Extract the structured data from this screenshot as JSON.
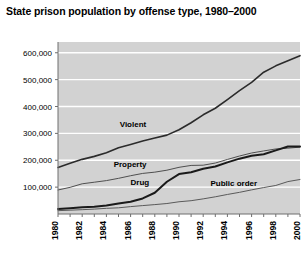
{
  "chart_data": {
    "type": "line",
    "title": "State prison population by offense type, 1980–2000",
    "xlabel": "",
    "ylabel": "",
    "xlim": [
      1980,
      2000
    ],
    "ylim": [
      0,
      640000
    ],
    "grid": true,
    "grid_axis": "y",
    "legend_position": "inline-annotations",
    "plot_background": "#d2d2d2",
    "grid_color": "#ffffff",
    "axis_color": "#6e6e6e",
    "x": [
      1980,
      1981,
      1982,
      1983,
      1984,
      1985,
      1986,
      1987,
      1988,
      1989,
      1990,
      1991,
      1992,
      1993,
      1994,
      1995,
      1996,
      1997,
      1998,
      1999,
      2000
    ],
    "y_ticks": [
      100000,
      200000,
      300000,
      400000,
      500000,
      600000
    ],
    "y_tick_labels": [
      "100,000",
      "200,000",
      "300,000",
      "400,000",
      "500,000",
      "600,000"
    ],
    "x_ticks": [
      1980,
      1982,
      1984,
      1986,
      1988,
      1990,
      1992,
      1994,
      1996,
      1998,
      2000
    ],
    "x_tick_labels": [
      "1980",
      "1982",
      "1984",
      "1986",
      "1988",
      "1990",
      "1992",
      "1994",
      "1996",
      "1998",
      "2000"
    ],
    "series": [
      {
        "name": "Violent",
        "color": "#2b2b2b",
        "width": 1.6,
        "label_x": 1985.1,
        "label_y": 322000,
        "values": [
          173300,
          188800,
          203300,
          214400,
          227700,
          246200,
          258600,
          271300,
          282700,
          293500,
          313600,
          339700,
          369100,
          393500,
          425700,
          459000,
          490000,
          527600,
          551300,
          570000,
          589100
        ]
      },
      {
        "name": "Property",
        "color": "#4f4f4f",
        "width": 1.0,
        "label_x": 1984.6,
        "label_y": 175000,
        "values": [
          89300,
          99200,
          112400,
          118300,
          124300,
          132700,
          142400,
          151000,
          155700,
          163000,
          173700,
          180700,
          181600,
          189600,
          203000,
          215800,
          227000,
          234600,
          242000,
          245000,
          248800
        ]
      },
      {
        "name": "Drug",
        "color": "#1a1a1a",
        "width": 2.0,
        "label_x": 1986.0,
        "label_y": 108000,
        "values": [
          19000,
          21700,
          25300,
          26600,
          31700,
          38900,
          45400,
          57900,
          79100,
          120100,
          148600,
          155200,
          168100,
          177000,
          192100,
          205900,
          216900,
          222100,
          236800,
          251200,
          251100
        ]
      },
      {
        "name": "Public order",
        "color": "#5a5a5a",
        "width": 1.0,
        "label_x": 1992.6,
        "label_y": 104000,
        "values": [
          12400,
          14200,
          16100,
          18200,
          21100,
          23000,
          27500,
          31300,
          35000,
          39000,
          45500,
          49500,
          56300,
          64000,
          72700,
          80600,
          89800,
          98400,
          106200,
          120600,
          128400
        ]
      }
    ]
  }
}
